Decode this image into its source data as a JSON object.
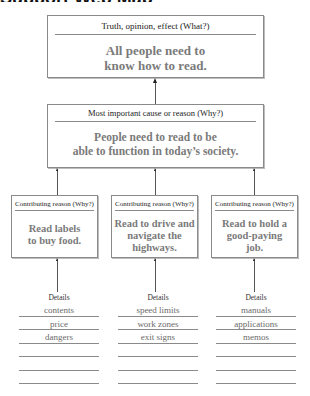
{
  "page": {
    "title_partial": "Support Web Map"
  },
  "colors": {
    "box_border": "#8a8a8a",
    "label_text": "#222222",
    "content_text": "#7a7a7a",
    "detail_text": "#6a6a6a",
    "connector": "#555555"
  },
  "top_box": {
    "label": "Truth, opinion, effect (What?)",
    "text_line1": "All people need to",
    "text_line2": "know how to read."
  },
  "middle_box": {
    "label": "Most important cause or reason (Why?)",
    "text_line1": "People need to read to be",
    "text_line2": "able to function in today’s society."
  },
  "reasons": [
    {
      "label": "Contributing reason (Why?)",
      "text_line1": "Read labels",
      "text_line2": "to buy food.",
      "text_line3": "",
      "details_label": "Details",
      "details": [
        "contents",
        "price",
        "dangers",
        "",
        "",
        ""
      ]
    },
    {
      "label": "Contributing reason (Why?)",
      "text_line1": "Read to drive and",
      "text_line2": "navigate the",
      "text_line3": "highways.",
      "details_label": "Details",
      "details": [
        "speed limits",
        "work zones",
        "exit signs",
        "",
        "",
        ""
      ]
    },
    {
      "label": "Contributing reason (Why?)",
      "text_line1": "Read to hold a",
      "text_line2": "good-paying",
      "text_line3": "job.",
      "details_label": "Details",
      "details": [
        "manuals",
        "applications",
        "memos",
        "",
        "",
        ""
      ]
    }
  ]
}
